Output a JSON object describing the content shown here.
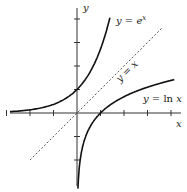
{
  "chart_data": {
    "type": "line",
    "title": "",
    "xlabel": "x",
    "ylabel": "y",
    "xlim": [
      -3,
      4
    ],
    "ylim": [
      -4,
      4
    ],
    "x_ticks": [
      -3,
      -2,
      -1,
      1,
      2,
      3,
      4
    ],
    "y_ticks": [
      -2,
      -1,
      1,
      2,
      3,
      4
    ],
    "grid": false,
    "series": [
      {
        "name": "y = e^x",
        "label": "y = e",
        "sup": "x",
        "style": "solid",
        "x": [
          -3,
          -2,
          -1,
          0,
          0.5,
          1,
          1.4
        ],
        "y": [
          0.05,
          0.14,
          0.37,
          1,
          1.65,
          2.72,
          4.06
        ]
      },
      {
        "name": "y = ln x",
        "label": "y = ln x",
        "style": "solid",
        "x": [
          0.05,
          0.1,
          0.25,
          0.5,
          1,
          2,
          3,
          4.1
        ],
        "y": [
          -3.0,
          -2.3,
          -1.39,
          -0.69,
          0,
          0.69,
          1.1,
          1.41
        ]
      },
      {
        "name": "y = x",
        "label": "y = x",
        "style": "dashed",
        "x": [
          -2,
          3.6
        ],
        "y": [
          -2,
          3.6
        ]
      }
    ]
  }
}
